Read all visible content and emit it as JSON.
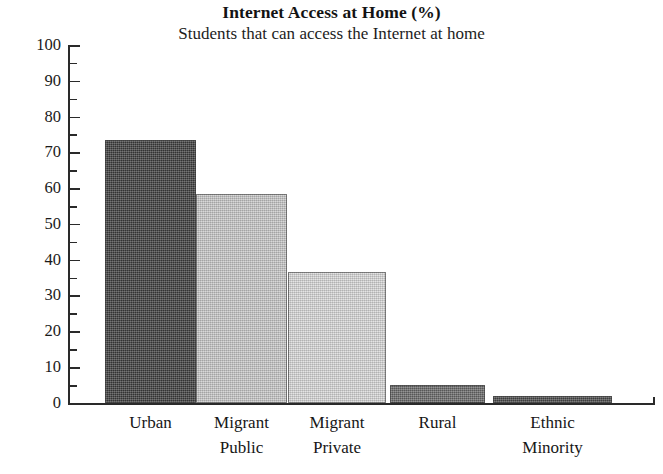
{
  "chart_data": {
    "type": "bar",
    "title": "Internet Access at Home (%)",
    "subtitle": "Students that can access the Internet at home",
    "xlabel": "",
    "ylabel": "",
    "ylim": [
      0,
      100
    ],
    "ytick_step": 10,
    "yminor_step": 5,
    "grid": false,
    "legend": "none",
    "categories": [
      "Urban",
      "Migrant\nPublic",
      "Migrant\nPrivate",
      "Rural",
      "Ethnic\nMinority"
    ],
    "values": [
      73.5,
      58.5,
      36.5,
      5,
      2
    ],
    "ytick_labels": [
      "0",
      "10",
      "20",
      "30",
      "40",
      "50",
      "60",
      "70",
      "80",
      "90",
      "100"
    ],
    "bar_colors": [
      "#3f3f3f",
      "#c9c9c9",
      "#dadada",
      "#6b6b6b",
      "#4b4b4b"
    ]
  }
}
